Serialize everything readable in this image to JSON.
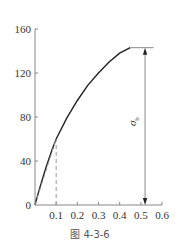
{
  "chart_data": {
    "type": "line",
    "title": "",
    "caption": "图 4-3-6",
    "xlabel": "",
    "ylabel": "",
    "xlim": [
      0,
      0.6
    ],
    "ylim": [
      0,
      160
    ],
    "x_ticks": [
      "0.1",
      "0.2",
      "0.3",
      "0.4",
      "0.5",
      "0.6"
    ],
    "y_ticks": [
      "0",
      "40",
      "80",
      "120",
      "160"
    ],
    "grid": false,
    "legend": null,
    "series": [
      {
        "name": "stress-strain curve",
        "style": "solid",
        "x": [
          0,
          0.02,
          0.05,
          0.08,
          0.1,
          0.15,
          0.2,
          0.25,
          0.3,
          0.35,
          0.4,
          0.45
        ],
        "y": [
          0,
          14,
          33,
          50,
          60,
          79,
          95,
          109,
          120,
          130,
          138,
          143
        ]
      },
      {
        "name": "initial tangent (dashed)",
        "style": "dashed",
        "x": [
          0,
          0.1
        ],
        "y": [
          0,
          60
        ]
      },
      {
        "name": "vertical reference at x=0.1 (dashed)",
        "style": "dashed",
        "x": [
          0.1,
          0.1
        ],
        "y": [
          0,
          60
        ]
      }
    ],
    "annotations": [
      {
        "type": "dimension-arrow",
        "label": "σb",
        "label_main": "σ",
        "label_sub": "b",
        "x": 0.52,
        "y_from": 143,
        "y_to": 0
      },
      {
        "type": "horizontal-line",
        "note": "peak stress level marker",
        "x_from": 0.45,
        "x_to": 0.56,
        "y": 143
      }
    ]
  },
  "labels": {
    "origin": "0",
    "sigma_main": "σ",
    "sigma_sub": "b",
    "caption": "图 4-3-6"
  }
}
